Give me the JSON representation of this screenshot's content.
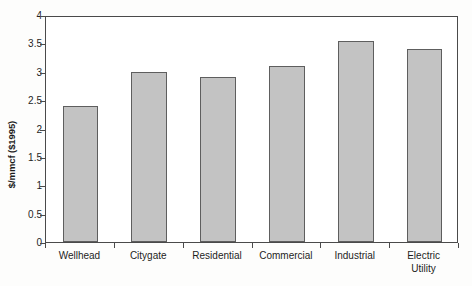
{
  "chart_data": {
    "type": "bar",
    "title": "",
    "subtitle": "",
    "xlabel": "",
    "ylabel": "$/mmcf ($1995)",
    "ylim": [
      0,
      4
    ],
    "yticks": [
      "0",
      "0.5",
      "1",
      "1.5",
      "2",
      "2.5",
      "3",
      "3.5",
      "4"
    ],
    "ytick_values": [
      0,
      0.5,
      1,
      1.5,
      2,
      2.5,
      3,
      3.5,
      4
    ],
    "grid": false,
    "legend": null,
    "legend_position": "none",
    "categories": [
      "Wellhead",
      "Citygate",
      "Residential",
      "Commercial",
      "Industrial",
      "Electric Utility"
    ],
    "category_lines": [
      [
        "Wellhead"
      ],
      [
        "Citygate"
      ],
      [
        "Residential"
      ],
      [
        "Commercial"
      ],
      [
        "Industrial"
      ],
      [
        "Electric",
        "Utility"
      ]
    ],
    "values": [
      2.4,
      3.0,
      2.9,
      3.1,
      3.55,
      3.4
    ],
    "bar_color": "#c3c3c3",
    "bar_border_color": "#5e5e5e",
    "axis_color": "#4a4a4a",
    "background_color": "#fdfdfc",
    "plot_background_color": "#ffffff",
    "text_color": "#1d1d1d"
  }
}
